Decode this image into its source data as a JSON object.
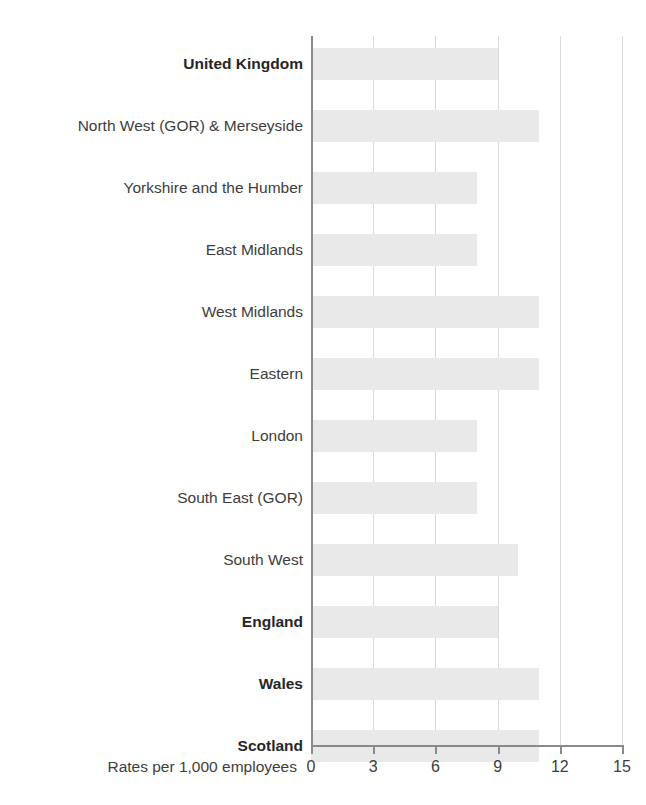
{
  "chart_data": {
    "type": "bar",
    "orientation": "horizontal",
    "title": "",
    "subtitle": "",
    "xlabel": "Rates per 1,000 employees",
    "ylabel": "",
    "xlim": [
      0,
      15
    ],
    "xticks": [
      0,
      3,
      6,
      9,
      12,
      15
    ],
    "xtick_labels": [
      "0",
      "3",
      "6",
      "9",
      "12",
      "15"
    ],
    "grid": "vertical",
    "legend": "none",
    "bar_color": "#e9e9e9",
    "axis_color": "#8a8a8a",
    "gridline_color": "#d9d9d9",
    "text_color": "#3d3d3d",
    "categories": [
      "United Kingdom",
      "North West (GOR) & Merseyside",
      "Yorkshire and the Humber",
      "East Midlands",
      "West Midlands",
      "Eastern",
      "London",
      "South East (GOR)",
      "South West",
      "England",
      "Wales",
      "Scotland"
    ],
    "emphasised_categories": [
      "United Kingdom",
      "England",
      "Wales",
      "Scotland"
    ],
    "values": [
      9,
      11,
      8,
      8,
      11,
      11,
      8,
      8,
      10,
      9,
      11,
      11
    ],
    "bars": [
      {
        "category": "United Kingdom",
        "value": 9,
        "bold": true
      },
      {
        "category": "North West (GOR) & Merseyside",
        "value": 11,
        "bold": false
      },
      {
        "category": "Yorkshire and the Humber",
        "value": 8,
        "bold": false
      },
      {
        "category": "East Midlands",
        "value": 8,
        "bold": false
      },
      {
        "category": "West Midlands",
        "value": 11,
        "bold": false
      },
      {
        "category": "Eastern",
        "value": 11,
        "bold": false
      },
      {
        "category": "London",
        "value": 8,
        "bold": false
      },
      {
        "category": "South East (GOR)",
        "value": 8,
        "bold": false
      },
      {
        "category": "South West",
        "value": 10,
        "bold": false
      },
      {
        "category": "England",
        "value": 9,
        "bold": true
      },
      {
        "category": "Wales",
        "value": 11,
        "bold": true
      },
      {
        "category": "Scotland",
        "value": 11,
        "bold": true
      }
    ]
  }
}
